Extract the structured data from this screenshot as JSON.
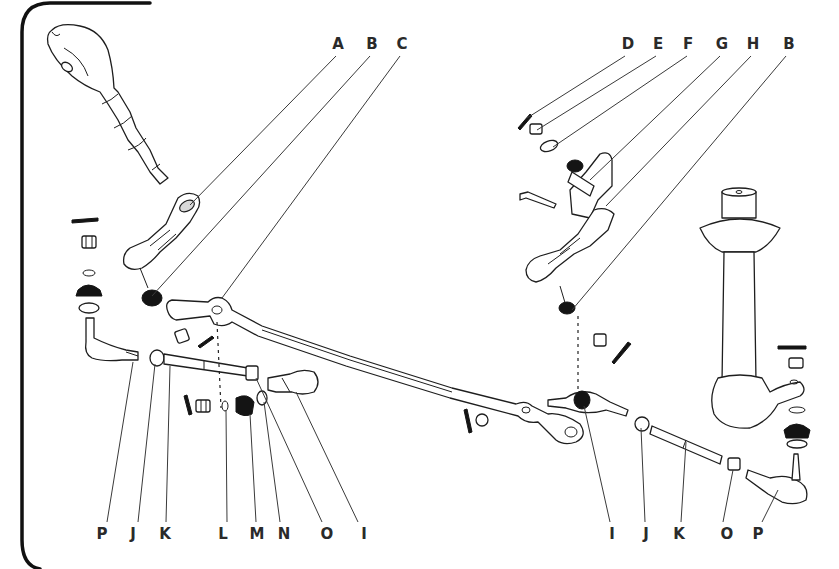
{
  "diagram": {
    "top_labels": [
      {
        "letter": "A",
        "x": 338,
        "y": 49,
        "lx1": 336,
        "ly1": 56,
        "lx2": 190,
        "ly2": 205
      },
      {
        "letter": "B",
        "x": 372,
        "y": 49,
        "lx1": 370,
        "ly1": 56,
        "lx2": 152,
        "ly2": 296
      },
      {
        "letter": "C",
        "x": 402,
        "y": 49,
        "lx1": 400,
        "ly1": 56,
        "lx2": 222,
        "ly2": 298
      },
      {
        "letter": "D",
        "x": 628,
        "y": 49,
        "lx1": 625,
        "ly1": 56,
        "lx2": 527,
        "ly2": 118
      },
      {
        "letter": "E",
        "x": 658,
        "y": 49,
        "lx1": 656,
        "ly1": 56,
        "lx2": 537,
        "ly2": 130
      },
      {
        "letter": "F",
        "x": 688,
        "y": 49,
        "lx1": 687,
        "ly1": 56,
        "lx2": 553,
        "ly2": 147
      },
      {
        "letter": "G",
        "x": 722,
        "y": 49,
        "lx1": 720,
        "ly1": 56,
        "lx2": 590,
        "ly2": 180
      },
      {
        "letter": "H",
        "x": 753,
        "y": 49,
        "lx1": 751,
        "ly1": 56,
        "lx2": 606,
        "ly2": 206
      },
      {
        "letter": "B",
        "x": 789,
        "y": 49,
        "lx1": 786,
        "ly1": 56,
        "lx2": 572,
        "ly2": 310
      }
    ],
    "bottom_labels": [
      {
        "letter": "P",
        "x": 102,
        "y": 539,
        "lx1": 107,
        "ly1": 522,
        "lx2": 133,
        "ly2": 362
      },
      {
        "letter": "J",
        "x": 133,
        "y": 539,
        "lx1": 138,
        "ly1": 522,
        "lx2": 155,
        "ly2": 364
      },
      {
        "letter": "K",
        "x": 165,
        "y": 539,
        "lx1": 166,
        "ly1": 522,
        "lx2": 170,
        "ly2": 366
      },
      {
        "letter": "L",
        "x": 223,
        "y": 539,
        "lx1": 227,
        "ly1": 522,
        "lx2": 226,
        "ly2": 410
      },
      {
        "letter": "M",
        "x": 257,
        "y": 539,
        "lx1": 256,
        "ly1": 522,
        "lx2": 250,
        "ly2": 414
      },
      {
        "letter": "N",
        "x": 284,
        "y": 539,
        "lx1": 280,
        "ly1": 522,
        "lx2": 264,
        "ly2": 402
      },
      {
        "letter": "O",
        "x": 327,
        "y": 539,
        "lx1": 322,
        "ly1": 522,
        "lx2": 262,
        "ly2": 378
      },
      {
        "letter": "I",
        "x": 364,
        "y": 539,
        "lx1": 358,
        "ly1": 522,
        "lx2": 296,
        "ly2": 392
      },
      {
        "letter": "I",
        "x": 612,
        "y": 539,
        "lx1": 610,
        "ly1": 522,
        "lx2": 584,
        "ly2": 406
      },
      {
        "letter": "J",
        "x": 646,
        "y": 539,
        "lx1": 645,
        "ly1": 522,
        "lx2": 641,
        "ly2": 428
      },
      {
        "letter": "K",
        "x": 679,
        "y": 539,
        "lx1": 681,
        "ly1": 522,
        "lx2": 686,
        "ly2": 442
      },
      {
        "letter": "O",
        "x": 727,
        "y": 539,
        "lx1": 723,
        "ly1": 522,
        "lx2": 733,
        "ly2": 470
      },
      {
        "letter": "P",
        "x": 758,
        "y": 539,
        "lx1": 762,
        "ly1": 522,
        "lx2": 778,
        "ly2": 488
      }
    ],
    "parts_legend": {
      "A": "Pitman arm",
      "B": "Ball joint dust seal",
      "C": "Center link (relay rod)",
      "D": "Cotter pin",
      "E": "Castellated nut",
      "F": "Washer",
      "G": "Idler arm bracket",
      "H": "Idler arm",
      "I": "Inner tie rod end",
      "J": "Clamp nut",
      "K": "Adjusting sleeve",
      "L": "Ring",
      "M": "Seal",
      "N": "Washer",
      "O": "Lock nut",
      "P": "Outer tie rod end"
    }
  }
}
